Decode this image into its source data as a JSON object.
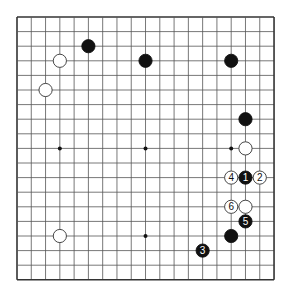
{
  "board": {
    "size": 19,
    "origin_x": 17,
    "origin_y": 17,
    "step_x": 14.28,
    "step_y": 14.6,
    "line_color": "#555555",
    "border_color": "#333333",
    "background": "#ffffff"
  },
  "hoshi": [
    [
      3,
      3
    ],
    [
      9,
      3
    ],
    [
      15,
      3
    ],
    [
      3,
      9
    ],
    [
      9,
      9
    ],
    [
      15,
      9
    ],
    [
      3,
      15
    ],
    [
      9,
      15
    ],
    [
      15,
      15
    ]
  ],
  "stones": [
    {
      "color": "black",
      "col": 5,
      "row": 2,
      "label": ""
    },
    {
      "color": "black",
      "col": 9,
      "row": 3,
      "label": ""
    },
    {
      "color": "black",
      "col": 15,
      "row": 3,
      "label": ""
    },
    {
      "color": "white",
      "col": 3,
      "row": 3,
      "label": ""
    },
    {
      "color": "white",
      "col": 2,
      "row": 5,
      "label": ""
    },
    {
      "color": "black",
      "col": 16,
      "row": 7,
      "label": ""
    },
    {
      "color": "white",
      "col": 16,
      "row": 9,
      "label": ""
    },
    {
      "color": "black",
      "col": 16,
      "row": 11,
      "label": "1"
    },
    {
      "color": "white",
      "col": 17,
      "row": 11,
      "label": "2"
    },
    {
      "color": "black",
      "col": 13,
      "row": 16,
      "label": "3"
    },
    {
      "color": "white",
      "col": 15,
      "row": 11,
      "label": "4"
    },
    {
      "color": "black",
      "col": 16,
      "row": 14,
      "label": "5"
    },
    {
      "color": "white",
      "col": 15,
      "row": 13,
      "label": "6"
    },
    {
      "color": "white",
      "col": 16,
      "row": 13,
      "label": ""
    },
    {
      "color": "black",
      "col": 15,
      "row": 15,
      "label": ""
    },
    {
      "color": "white",
      "col": 3,
      "row": 15,
      "label": ""
    }
  ]
}
